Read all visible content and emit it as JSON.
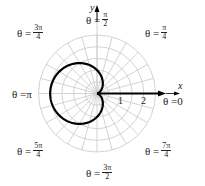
{
  "chart_data": {
    "type": "line",
    "subtype": "polar",
    "title": "",
    "equation": "r = 1 - cos(theta)",
    "curve_name": "cardioid",
    "xlabel": "x",
    "ylabel": "y",
    "radial_ticks": [
      "1",
      "2"
    ],
    "radial_grid_step": 0.5,
    "radial_max": 2.5,
    "angular_grid_step_deg": 15,
    "angle_labels": [
      {
        "id": "a0",
        "prefix": "θ = ",
        "value": "0"
      },
      {
        "id": "a1",
        "prefix": "θ = ",
        "num": "π",
        "den": "4"
      },
      {
        "id": "a2",
        "prefix": "θ = ",
        "num": "π",
        "den": "2"
      },
      {
        "id": "a3",
        "prefix": "θ = ",
        "num": "3π",
        "den": "4"
      },
      {
        "id": "a4",
        "prefix": "θ = ",
        "value": "π"
      },
      {
        "id": "a5",
        "prefix": "θ = ",
        "num": "5π",
        "den": "4"
      },
      {
        "id": "a6",
        "prefix": "θ = ",
        "num": "3π",
        "den": "2"
      },
      {
        "id": "a7",
        "prefix": "θ = ",
        "num": "7π",
        "den": "4"
      }
    ],
    "sample_points": [
      {
        "theta": "0",
        "r": 0
      },
      {
        "theta": "π/2",
        "r": 1
      },
      {
        "theta": "π",
        "r": 2
      },
      {
        "theta": "3π/2",
        "r": 1
      }
    ],
    "colors": {
      "curve": "#000000",
      "grid": "#c8c8c8",
      "axis": "#000000"
    }
  },
  "labels": {
    "x_axis": "x",
    "y_axis": "y",
    "tick1": "1",
    "tick2": "2",
    "theta0_prefix": "θ = ",
    "theta0_val": "0",
    "theta1_prefix": "θ = ",
    "theta1_num": "π",
    "theta1_den": "4",
    "theta2_prefix": "θ = ",
    "theta2_num": "π",
    "theta2_den": "2",
    "theta3_prefix": "θ = ",
    "theta3_num": "3π",
    "theta3_den": "4",
    "theta4_prefix": "θ = ",
    "theta4_val": "π",
    "theta5_prefix": "θ = ",
    "theta5_num": "5π",
    "theta5_den": "4",
    "theta6_prefix": "θ = ",
    "theta6_num": "3π",
    "theta6_den": "2",
    "theta7_prefix": "θ = ",
    "theta7_num": "7π",
    "theta7_den": "4"
  }
}
